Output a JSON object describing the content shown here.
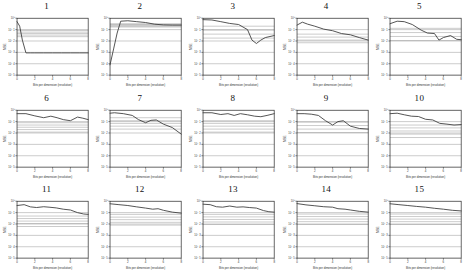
{
  "figure": {
    "layout": "5 columns x 3 rows of small multiples",
    "panel_count": 15
  },
  "axes": {
    "xlabel": "Bits per dimension (resolution)",
    "ylabel": "MSE",
    "xticks": [
      "0",
      "2",
      "4",
      "6",
      "8"
    ],
    "xlim": [
      0,
      8
    ],
    "yscale": "log",
    "yticks": [
      "10^0",
      "10^-1",
      "10^-2",
      "10^-3",
      "10^-4",
      "10^-5"
    ],
    "grid": "horizontal only",
    "legend": "none"
  },
  "chart_data": [
    {
      "type": "line",
      "title": "1",
      "xlabel": "Bits per dimension (resolution)",
      "ylabel": "MSE",
      "yscale": "log",
      "xlim": [
        0,
        8
      ],
      "ylim": [
        1e-05,
        1
      ],
      "x": [
        0,
        0.3,
        0.6,
        1.0,
        1.5,
        2,
        3,
        4,
        5,
        6,
        7,
        8
      ],
      "values": [
        0.5,
        0.2,
        0.012,
        0.0009,
        0.0009,
        0.0009,
        0.0009,
        0.0009,
        0.0009,
        0.0009,
        0.0009,
        0.0009
      ],
      "extra_flat_lines": [
        0.085,
        0.06,
        0.045,
        0.033,
        0.024
      ]
    },
    {
      "type": "line",
      "title": "2",
      "xlabel": "Bits per dimension (resolution)",
      "ylabel": "MSE",
      "yscale": "log",
      "xlim": [
        0,
        8
      ],
      "ylim": [
        1e-05,
        1
      ],
      "x": [
        0,
        0.4,
        0.8,
        1.2,
        2,
        3,
        4,
        5,
        6,
        7,
        8
      ],
      "values": [
        8e-05,
        0.002,
        0.05,
        0.55,
        0.6,
        0.5,
        0.42,
        0.3,
        0.26,
        0.25,
        0.25
      ],
      "extra_flat_lines": [
        0.33,
        0.28,
        0.24,
        0.2,
        0.17
      ]
    },
    {
      "type": "line",
      "title": "3",
      "xlabel": "Bits per dimension (resolution)",
      "ylabel": "MSE",
      "yscale": "log",
      "xlim": [
        0,
        8
      ],
      "ylim": [
        1e-05,
        1
      ],
      "x": [
        0,
        1,
        2,
        3,
        4,
        5,
        5.5,
        6,
        6.5,
        7,
        8
      ],
      "values": [
        0.75,
        0.7,
        0.5,
        0.35,
        0.28,
        0.1,
        0.012,
        0.006,
        0.012,
        0.02,
        0.03
      ],
      "extra_flat_lines": [
        0.2,
        0.09,
        0.04,
        0.018
      ]
    },
    {
      "type": "line",
      "title": "4",
      "xlabel": "Bits per dimension (resolution)",
      "ylabel": "MSE",
      "yscale": "log",
      "xlim": [
        0,
        8
      ],
      "ylim": [
        1e-05,
        1
      ],
      "x": [
        0,
        0.6,
        1.2,
        2,
        3,
        4,
        5,
        6,
        7,
        8
      ],
      "values": [
        0.25,
        0.45,
        0.3,
        0.2,
        0.11,
        0.08,
        0.045,
        0.035,
        0.02,
        0.012
      ],
      "extra_flat_lines": [
        0.04,
        0.022,
        0.012,
        0.007
      ]
    },
    {
      "type": "line",
      "title": "5",
      "xlabel": "Bits per dimension (resolution)",
      "ylabel": "MSE",
      "yscale": "log",
      "xlim": [
        0,
        8
      ],
      "ylim": [
        1e-05,
        1
      ],
      "x": [
        0,
        0.8,
        1.6,
        2.5,
        3.5,
        4.2,
        5,
        5.5,
        6,
        6.8,
        7.5,
        8
      ],
      "values": [
        0.33,
        0.55,
        0.5,
        0.28,
        0.09,
        0.05,
        0.045,
        0.012,
        0.02,
        0.03,
        0.014,
        0.013
      ],
      "extra_flat_lines": [
        0.13,
        0.055,
        0.025,
        0.011
      ]
    },
    {
      "type": "line",
      "title": "6",
      "xlabel": "Bits per dimension (resolution)",
      "ylabel": "MSE",
      "yscale": "log",
      "xlim": [
        0,
        8
      ],
      "ylim": [
        1e-05,
        1
      ],
      "x": [
        0,
        1,
        2,
        3,
        3.8,
        4.5,
        5.2,
        6,
        6.8,
        7.4,
        8
      ],
      "values": [
        0.5,
        0.5,
        0.32,
        0.22,
        0.3,
        0.22,
        0.15,
        0.12,
        0.25,
        0.2,
        0.15
      ],
      "extra_flat_lines": [
        0.08,
        0.05,
        0.032,
        0.02,
        0.012
      ]
    },
    {
      "type": "line",
      "title": "7",
      "xlabel": "Bits per dimension (resolution)",
      "ylabel": "MSE",
      "yscale": "log",
      "xlim": [
        0,
        8
      ],
      "ylim": [
        1e-05,
        1
      ],
      "x": [
        0,
        0.5,
        1.5,
        2.5,
        3.2,
        4,
        4.6,
        5.2,
        6,
        7,
        8
      ],
      "values": [
        0.55,
        0.6,
        0.5,
        0.35,
        0.15,
        0.08,
        0.13,
        0.14,
        0.06,
        0.03,
        0.008
      ],
      "extra_flat_lines": [
        0.22,
        0.12,
        0.07,
        0.04,
        0.022
      ]
    },
    {
      "type": "line",
      "title": "8",
      "xlabel": "Bits per dimension (resolution)",
      "ylabel": "MSE",
      "yscale": "log",
      "xlim": [
        0,
        8
      ],
      "ylim": [
        1e-05,
        1
      ],
      "x": [
        0,
        1,
        2,
        2.8,
        3.5,
        4.2,
        5,
        5.8,
        6.5,
        7.2,
        8
      ],
      "values": [
        0.6,
        0.6,
        0.42,
        0.5,
        0.35,
        0.5,
        0.4,
        0.3,
        0.27,
        0.35,
        0.5
      ],
      "extra_flat_lines": [
        0.12,
        0.07,
        0.04,
        0.022,
        0.012
      ]
    },
    {
      "type": "line",
      "title": "9",
      "xlabel": "Bits per dimension (resolution)",
      "ylabel": "MSE",
      "yscale": "log",
      "xlim": [
        0,
        8
      ],
      "ylim": [
        1e-05,
        1
      ],
      "x": [
        0,
        0.8,
        1.6,
        2.4,
        3.2,
        4,
        4.6,
        5.2,
        6,
        7,
        8
      ],
      "values": [
        0.5,
        0.5,
        0.45,
        0.35,
        0.12,
        0.05,
        0.1,
        0.12,
        0.04,
        0.025,
        0.022
      ],
      "extra_flat_lines": [
        0.09,
        0.045,
        0.022,
        0.011
      ]
    },
    {
      "type": "line",
      "title": "10",
      "xlabel": "Bits per dimension (resolution)",
      "ylabel": "MSE",
      "yscale": "log",
      "xlim": [
        0,
        8
      ],
      "ylim": [
        1e-05,
        1
      ],
      "x": [
        0,
        0.8,
        1.6,
        2.4,
        3.2,
        4,
        4.8,
        5.6,
        6.4,
        7.2,
        8
      ],
      "values": [
        0.5,
        0.55,
        0.4,
        0.3,
        0.28,
        0.16,
        0.14,
        0.07,
        0.06,
        0.05,
        0.055
      ],
      "extra_flat_lines": [
        0.05,
        0.028,
        0.015,
        0.008,
        0.004
      ]
    },
    {
      "type": "line",
      "title": "11",
      "xlabel": "Bits per dimension (resolution)",
      "ylabel": "MSE",
      "yscale": "log",
      "xlim": [
        0,
        8
      ],
      "ylim": [
        1e-05,
        1
      ],
      "x": [
        0,
        0.8,
        1.5,
        2.2,
        3,
        3.6,
        4.4,
        5.2,
        6,
        6.8,
        7.5,
        8
      ],
      "values": [
        0.42,
        0.5,
        0.32,
        0.28,
        0.33,
        0.3,
        0.26,
        0.2,
        0.17,
        0.1,
        0.075,
        0.07
      ],
      "extra_flat_lines": [
        0.05,
        0.03,
        0.018,
        0.011,
        0.006
      ]
    },
    {
      "type": "line",
      "title": "12",
      "xlabel": "Bits per dimension (resolution)",
      "ylabel": "MSE",
      "yscale": "log",
      "xlim": [
        0,
        8
      ],
      "ylim": [
        1e-05,
        1
      ],
      "x": [
        0,
        1,
        2,
        3,
        4,
        4.8,
        5.4,
        6,
        7,
        8
      ],
      "values": [
        0.6,
        0.5,
        0.42,
        0.32,
        0.25,
        0.2,
        0.22,
        0.16,
        0.11,
        0.09
      ],
      "extra_flat_lines": [
        0.07,
        0.04,
        0.024,
        0.014,
        0.008
      ]
    },
    {
      "type": "line",
      "title": "13",
      "xlabel": "Bits per dimension (resolution)",
      "ylabel": "MSE",
      "yscale": "log",
      "xlim": [
        0,
        8
      ],
      "ylim": [
        1e-05,
        1
      ],
      "x": [
        0,
        0.8,
        1.5,
        2.2,
        3,
        3.8,
        4.5,
        5.2,
        6,
        6.8,
        7.4,
        8
      ],
      "values": [
        0.55,
        0.5,
        0.33,
        0.3,
        0.38,
        0.3,
        0.32,
        0.28,
        0.25,
        0.15,
        0.12,
        0.11
      ],
      "extra_flat_lines": [
        0.07,
        0.042,
        0.025,
        0.015,
        0.009
      ]
    },
    {
      "type": "line",
      "title": "14",
      "xlabel": "Bits per dimension (resolution)",
      "ylabel": "MSE",
      "yscale": "log",
      "xlim": [
        0,
        8
      ],
      "ylim": [
        1e-05,
        1
      ],
      "x": [
        0,
        1,
        2,
        3,
        4,
        4.6,
        5.4,
        6,
        7,
        8
      ],
      "values": [
        0.62,
        0.48,
        0.4,
        0.33,
        0.3,
        0.22,
        0.2,
        0.17,
        0.13,
        0.11
      ],
      "extra_flat_lines": [
        0.075,
        0.045,
        0.027,
        0.016,
        0.009
      ]
    },
    {
      "type": "line",
      "title": "15",
      "xlabel": "Bits per dimension (resolution)",
      "ylabel": "MSE",
      "yscale": "log",
      "xlim": [
        0,
        8
      ],
      "ylim": [
        1e-05,
        1
      ],
      "x": [
        0,
        1,
        2,
        3,
        4,
        5,
        6,
        7,
        8
      ],
      "values": [
        0.6,
        0.5,
        0.42,
        0.35,
        0.3,
        0.24,
        0.2,
        0.16,
        0.14
      ],
      "extra_flat_lines": [
        0.075,
        0.045,
        0.027,
        0.016,
        0.009
      ]
    }
  ]
}
